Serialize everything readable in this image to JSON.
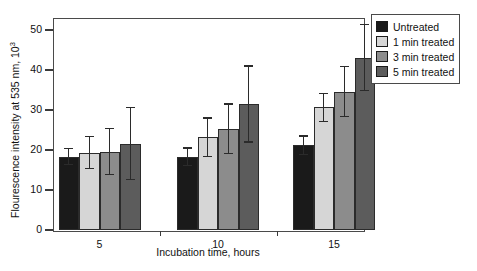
{
  "chart_data": {
    "type": "bar",
    "title": "",
    "xlabel": "Incubation time, hours",
    "ylabel": "Flourescence intensity at 535 nm, 10",
    "ylabel_exponent": "3",
    "categories": [
      "5",
      "10",
      "15"
    ],
    "xtick_labels": [
      "5",
      "10",
      "15"
    ],
    "ytick_labels": [
      "0",
      "10",
      "20",
      "30",
      "40",
      "50"
    ],
    "ylim": [
      0,
      53
    ],
    "yticks": [
      0,
      10,
      20,
      30,
      40,
      50
    ],
    "grid": false,
    "legend_position": "outside-right-top",
    "series": [
      {
        "name": "Untreated",
        "color": "#1a1a1a",
        "values": [
          18.3,
          18.3,
          21.2
        ],
        "errors": [
          2.0,
          2.2,
          2.3
        ]
      },
      {
        "name": "1 min treated",
        "color": "#d6d6d6",
        "values": [
          19.3,
          23.2,
          30.7
        ],
        "errors": [
          4.0,
          4.8,
          3.5
        ]
      },
      {
        "name": "3 min treated",
        "color": "#8c8c8c",
        "values": [
          19.6,
          25.3,
          34.6
        ],
        "errors": [
          5.8,
          6.2,
          6.3
        ]
      },
      {
        "name": "5 min treated",
        "color": "#5c5c5c",
        "values": [
          21.6,
          31.5,
          43.1
        ],
        "errors": [
          9.0,
          9.5,
          8.3
        ]
      }
    ]
  },
  "legend": {
    "items": [
      {
        "label": "Untreated",
        "color": "#1a1a1a"
      },
      {
        "label": "1 min treated",
        "color": "#d6d6d6"
      },
      {
        "label": "3 min treated",
        "color": "#8c8c8c"
      },
      {
        "label": "5 min treated",
        "color": "#5c5c5c"
      }
    ]
  },
  "colors": {
    "axis": "#4a4a4a",
    "text": "#111111",
    "background": "#ffffff"
  }
}
